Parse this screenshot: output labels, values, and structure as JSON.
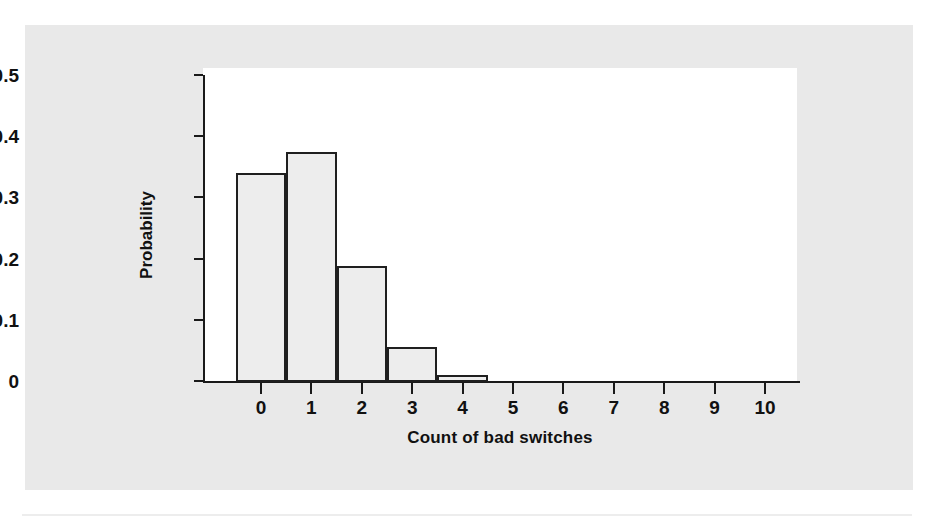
{
  "figure": {
    "background_color": "#e9e9e9",
    "plot_background_color": "#ffffff",
    "axis_color": "#1a1a1a",
    "bar_fill_color": "#ededed",
    "bar_edge_color": "#1f1f1f"
  },
  "chart_data": {
    "type": "bar",
    "title": "",
    "subtitle": "",
    "xlabel": "Count of bad switches",
    "ylabel": "Probability",
    "categories": [
      "0",
      "1",
      "2",
      "3",
      "4",
      "5",
      "6",
      "7",
      "8",
      "9",
      "10"
    ],
    "values": [
      0.34,
      0.375,
      0.188,
      0.055,
      0.01,
      0.0,
      0.0,
      0.0,
      0.0,
      0.0,
      0.0
    ],
    "xlim": [
      -0.5,
      10.8
    ],
    "ylim": [
      0,
      0.5
    ],
    "ytick_labels": [
      "0.5",
      "0.4",
      "0.3",
      "0.2",
      "0.1",
      "0"
    ],
    "ytick_values": [
      0.5,
      0.4,
      0.3,
      0.2,
      0.1,
      0
    ],
    "xtick_labels": [
      "0",
      "1",
      "2",
      "3",
      "4",
      "5",
      "6",
      "7",
      "8",
      "9",
      "10"
    ],
    "grid": false,
    "legend": null,
    "annotations": []
  }
}
